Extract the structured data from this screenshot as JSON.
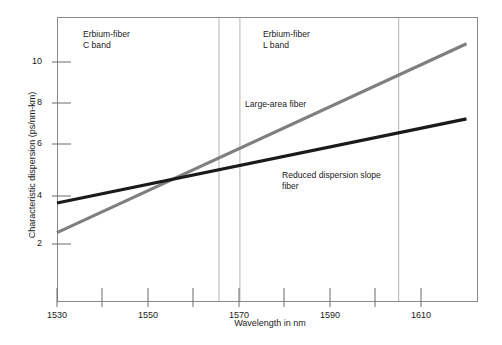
{
  "chart_data": {
    "type": "line",
    "title": "",
    "xlabel": "Wavelength in nm",
    "ylabel": "Characteristic dispersion (ps/nm-km)",
    "xlim": [
      1527,
      1622
    ],
    "ylim": [
      0.0,
      11.8
    ],
    "grid": false,
    "legend_position": "inline-annotations",
    "xticks": [
      1530,
      1540,
      1550,
      1560,
      1570,
      1580,
      1590,
      1600,
      1610
    ],
    "xticklabels": [
      "1530",
      "",
      "1550",
      "",
      "1570",
      "",
      "1590",
      "",
      "1610"
    ],
    "yticks": [
      2,
      4,
      6,
      8,
      10
    ],
    "yticklabels": [
      "2",
      "4",
      "6",
      "8",
      "10"
    ],
    "series": [
      {
        "name": "Large-area fiber",
        "color": "#7f7f7f",
        "width": 3.2,
        "x": [
          1530,
          1620
        ],
        "values": [
          2.5,
          10.8
        ]
      },
      {
        "name": "Reduced dispersion slope fiber",
        "color": "#1a1a1a",
        "width": 3.2,
        "x": [
          1530,
          1620
        ],
        "values": [
          3.8,
          7.5
        ]
      }
    ],
    "vertical_markers": [
      {
        "name": "c-band-end",
        "x": 1565.6
      },
      {
        "name": "l-band-start",
        "x": 1570.2
      },
      {
        "name": "l-band-end",
        "x": 1605.1
      }
    ],
    "annotations": [
      {
        "name": "erbium-c-band",
        "line1": "Erbium-fiber",
        "line2": "C band",
        "x": 1542,
        "y": 11.2
      },
      {
        "name": "erbium-l-band",
        "line1": "Erbium-fiber",
        "line2": "L band",
        "x": 1582,
        "y": 11.2
      },
      {
        "name": "large-area-fiber",
        "line1": "Large-area fiber",
        "line2": "",
        "x": 1571,
        "y": 7.6
      },
      {
        "name": "reduced-dispersion-slope-fiber",
        "line1": "Reduced dispersion slope",
        "line2": "fiber",
        "x": 1593,
        "y": 4.4
      }
    ]
  },
  "axes": {
    "ylabel": "Characteristic dispersion (ps/nm-km)",
    "xlabel": "Wavelength in nm",
    "y_ticks": [
      {
        "value": "10"
      },
      {
        "value": "8"
      },
      {
        "value": "6"
      },
      {
        "value": "4"
      },
      {
        "value": "2"
      }
    ],
    "x_ticks": [
      {
        "value": "1530"
      },
      {
        "value": "1550"
      },
      {
        "value": "1570"
      },
      {
        "value": "1590"
      },
      {
        "value": "1610"
      }
    ]
  },
  "annotations": {
    "c_band_line1": "Erbium-fiber",
    "c_band_line2": "C band",
    "l_band_line1": "Erbium-fiber",
    "l_band_line2": "L band",
    "large_area": "Large-area fiber",
    "reduced_line1": "Reduced dispersion slope",
    "reduced_line2": "fiber"
  },
  "colors": {
    "large_area_fiber": "#7f7f7f",
    "reduced_dispersion_fiber": "#1a1a1a",
    "frame": "#8a8a8a",
    "band_marker": "#b0b0b0",
    "background": "#ffffff"
  }
}
